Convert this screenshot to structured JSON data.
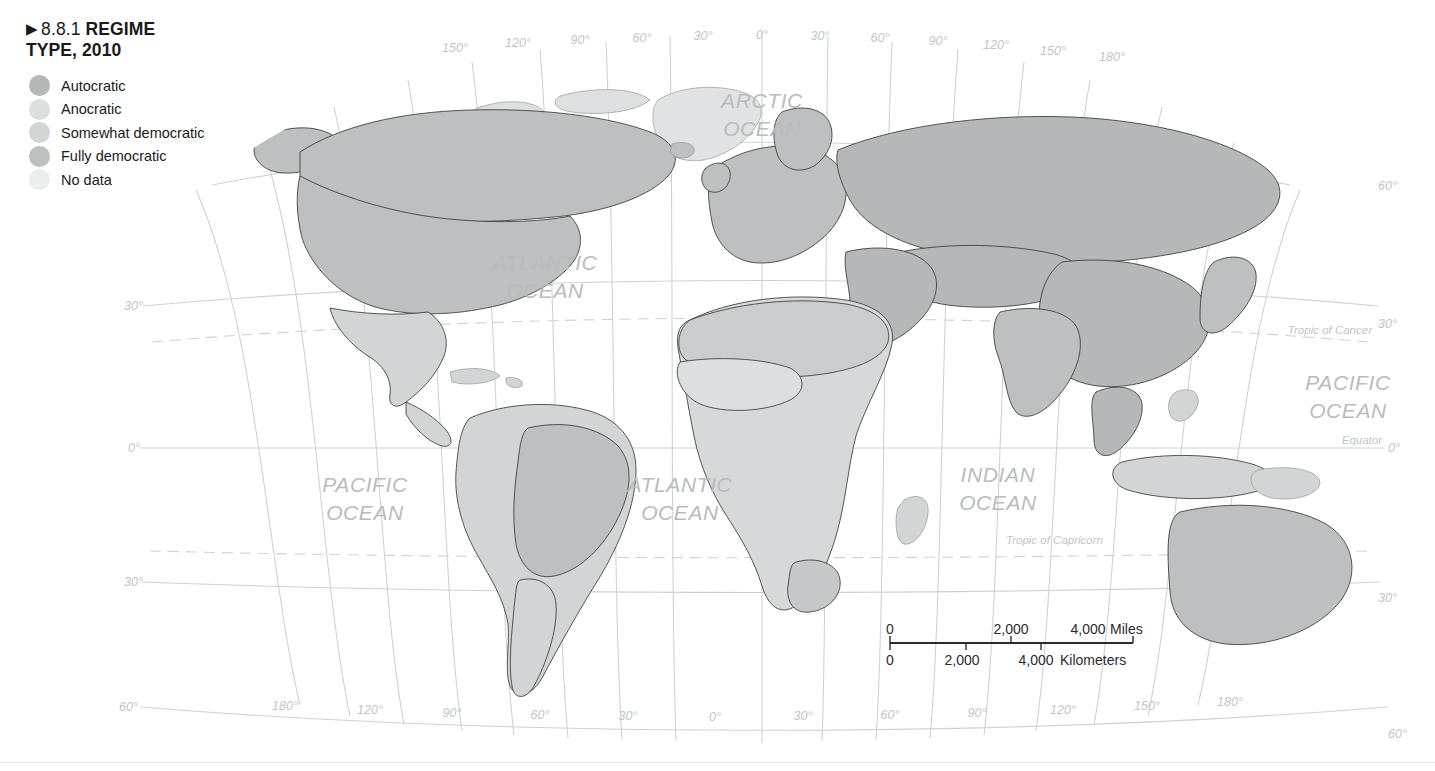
{
  "figure": {
    "marker": "▶",
    "number": "8.8.1",
    "title": "REGIME",
    "title_line2": "TYPE, 2010"
  },
  "legend": {
    "items": [
      {
        "label": "Autocratic",
        "color": "#b5b7b8",
        "key": "autocratic"
      },
      {
        "label": "Anocratic",
        "color": "#dcdedf",
        "key": "anocratic"
      },
      {
        "label": "Somewhat democratic",
        "color": "#d2d4d5",
        "key": "somewhat-democratic"
      },
      {
        "label": "Fully democratic",
        "color": "#bdbfc0",
        "key": "fully-democratic"
      },
      {
        "label": "No data",
        "color": "#eceded",
        "key": "no-data"
      }
    ]
  },
  "map": {
    "ocean_labels": [
      {
        "id": "arctic",
        "line1": "ARCTIC",
        "line2": "OCEAN",
        "x": 762,
        "y": 108
      },
      {
        "id": "atlantic-north",
        "line1": "ATLANTIC",
        "line2": "OCEAN",
        "x": 545,
        "y": 270
      },
      {
        "id": "atlantic-south",
        "line1": "ATLANTIC",
        "line2": "OCEAN",
        "x": 637,
        "y": 492
      },
      {
        "id": "pacific-west",
        "line1": "PACIFIC",
        "line2": "OCEAN",
        "x": 327,
        "y": 492
      },
      {
        "id": "pacific-east",
        "line1": "PACIFIC",
        "line2": "OCEAN",
        "x": 1305,
        "y": 390
      },
      {
        "id": "indian",
        "line1": "INDIAN",
        "line2": "OCEAN",
        "x": 957,
        "y": 482
      }
    ],
    "reference_lines": [
      {
        "id": "tropic-of-cancer",
        "label": "Tropic of Cancer",
        "x": 1290,
        "y": 334
      },
      {
        "id": "equator",
        "label": "Equator",
        "x": 1355,
        "y": 448
      },
      {
        "id": "tropic-of-capricorn",
        "label": "Tropic of Capricorn",
        "x": 1042,
        "y": 546
      }
    ],
    "top_longitude_labels": [
      {
        "label": "150°",
        "x": 455,
        "y": 52
      },
      {
        "label": "120°",
        "x": 518,
        "y": 47
      },
      {
        "label": "90°",
        "x": 580,
        "y": 44
      },
      {
        "label": "60°",
        "x": 642,
        "y": 42
      },
      {
        "label": "30°",
        "x": 703,
        "y": 40
      },
      {
        "label": "0°",
        "x": 762,
        "y": 39
      },
      {
        "label": "30°",
        "x": 820,
        "y": 40
      },
      {
        "label": "60°",
        "x": 880,
        "y": 42
      },
      {
        "label": "90°",
        "x": 938,
        "y": 45
      },
      {
        "label": "120°",
        "x": 996,
        "y": 49
      },
      {
        "label": "150°",
        "x": 1053,
        "y": 55
      },
      {
        "label": "180°",
        "x": 1112,
        "y": 61
      }
    ],
    "bottom_longitude_labels": [
      {
        "label": "180°",
        "x": 285,
        "y": 710
      },
      {
        "label": "120°",
        "x": 370,
        "y": 714
      },
      {
        "label": "90°",
        "x": 452,
        "y": 717
      },
      {
        "label": "60°",
        "x": 540,
        "y": 719
      },
      {
        "label": "30°",
        "x": 628,
        "y": 720
      },
      {
        "label": "0°",
        "x": 715,
        "y": 721
      },
      {
        "label": "30°",
        "x": 803,
        "y": 720
      },
      {
        "label": "60°",
        "x": 890,
        "y": 719
      },
      {
        "label": "90°",
        "x": 977,
        "y": 717
      },
      {
        "label": "120°",
        "x": 1063,
        "y": 714
      },
      {
        "label": "150°",
        "x": 1147,
        "y": 710
      },
      {
        "label": "180°",
        "x": 1230,
        "y": 706
      }
    ],
    "left_latitude_labels": [
      {
        "label": "30°",
        "x": 127,
        "y": 306
      },
      {
        "label": "0°",
        "x": 133,
        "y": 448
      },
      {
        "label": "30°",
        "x": 127,
        "y": 581
      },
      {
        "label": "60°",
        "x": 120,
        "y": 707
      }
    ],
    "right_latitude_labels": [
      {
        "label": "60°",
        "x": 1392,
        "y": 186
      },
      {
        "label": "30°",
        "x": 1392,
        "y": 324
      },
      {
        "label": "0°",
        "x": 1398,
        "y": 448
      },
      {
        "label": "30°",
        "x": 1392,
        "y": 598
      },
      {
        "label": "60°",
        "x": 1398,
        "y": 734
      }
    ]
  },
  "scale_bar": {
    "miles": {
      "ticks": [
        "0",
        "2,000",
        "4,000"
      ],
      "unit": "Miles"
    },
    "kilometers": {
      "ticks": [
        "0",
        "2,000",
        "4,000"
      ],
      "unit": "Kilometers"
    }
  },
  "colors": {
    "autocratic": "#b5b7b8",
    "anocratic": "#dcdedf",
    "somewhat_democratic": "#d2d4d5",
    "fully_democratic": "#bdbfc0",
    "no_data": "#eceded",
    "graticule": "#cfd2d4",
    "coast": "#3a3a3a",
    "label_gray": "#b9bcbe",
    "text": "#1a1a1a"
  }
}
